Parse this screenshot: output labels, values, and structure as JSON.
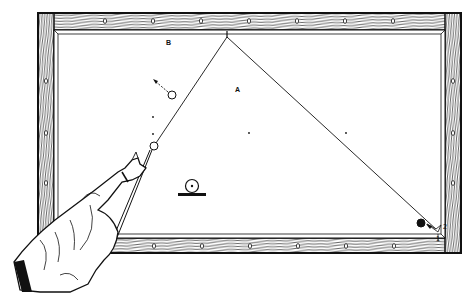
{
  "diagram": {
    "type": "billiards-shot-illustration",
    "colors": {
      "ink": "#111111",
      "paper": "#ffffff",
      "wood_grain": "#222222"
    },
    "labels": {
      "point_a": "A",
      "point_b": "B",
      "corner_mark_1": "1",
      "corner_mark_2": "2"
    },
    "table": {
      "outer_frame": {
        "x": 38,
        "y": 13,
        "w": 423,
        "h": 240
      },
      "playing_surface": {
        "x": 56,
        "y": 32,
        "w": 388,
        "h": 204
      },
      "top_rail_diamonds_x": [
        105,
        153,
        201,
        249,
        297,
        345,
        393
      ],
      "bottom_rail_diamonds_x": [
        154,
        202,
        250,
        298,
        346,
        394
      ],
      "left_rail_diamonds_y": [
        81,
        133,
        183
      ],
      "right_rail_diamonds_y": [
        81,
        133,
        183
      ]
    },
    "balls": [
      {
        "name": "cue-ball",
        "x": 154,
        "y": 146,
        "r": 4,
        "filled": false
      },
      {
        "name": "object-ball-white",
        "x": 172,
        "y": 95,
        "r": 4,
        "filled": false
      },
      {
        "name": "object-ball-black",
        "x": 421,
        "y": 223,
        "r": 4,
        "filled": true
      },
      {
        "name": "spot-ball-symbol",
        "x": 192,
        "y": 184,
        "r": 6,
        "filled": false
      }
    ],
    "shot_path": [
      {
        "x": 154,
        "y": 146
      },
      {
        "x": 227,
        "y": 37
      },
      {
        "x": 438,
        "y": 231
      }
    ],
    "markers": [
      {
        "x": 153,
        "y": 117
      },
      {
        "x": 153,
        "y": 134
      },
      {
        "x": 249,
        "y": 133
      },
      {
        "x": 346,
        "y": 133
      }
    ]
  }
}
